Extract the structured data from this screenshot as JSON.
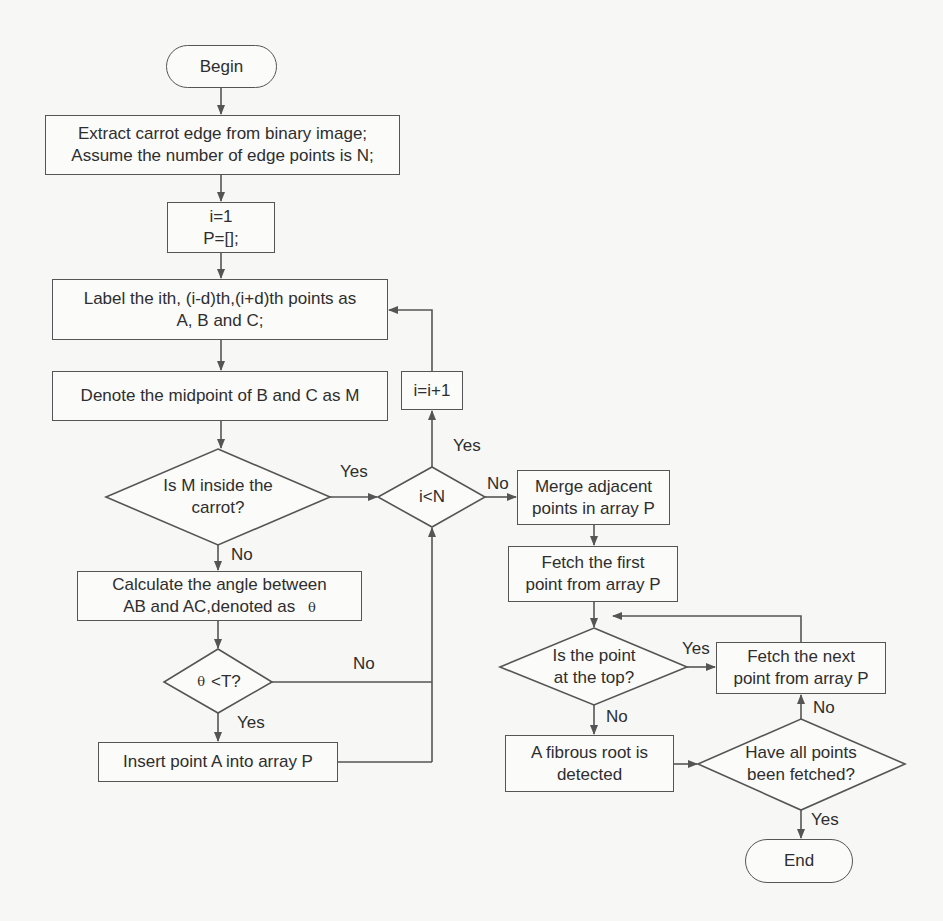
{
  "diagram": {
    "type": "flowchart",
    "colors": {
      "line": "#555555",
      "text": "#2e2e2e",
      "background": "#f7f7f5",
      "box_fill": "#fbfbfa"
    },
    "nodes": {
      "begin": {
        "label": "Begin"
      },
      "extract": {
        "line1": "Extract carrot edge from binary image;",
        "line2": "Assume the number of edge points is N;"
      },
      "init": {
        "line1": "i=1",
        "line2": "P=[];"
      },
      "label_points": {
        "line1": "Label the ith, (i-d)th,(i+d)th points as",
        "line2": "A, B and C;"
      },
      "midpoint": {
        "label": "Denote the midpoint of B and C as M"
      },
      "inside_decision": {
        "line1": "Is M inside the",
        "line2": "carrot?"
      },
      "calc_angle": {
        "line1": "Calculate the angle between",
        "line2": "AB and AC,denoted as",
        "symbol": "θ"
      },
      "angle_decision": {
        "symbol": "θ",
        "label": "<T?"
      },
      "insert_point": {
        "label": "Insert point A into array P"
      },
      "increment": {
        "label": "i=i+1"
      },
      "loop_decision": {
        "label": "i<N"
      },
      "merge": {
        "line1": "Merge adjacent",
        "line2": "points in array P"
      },
      "fetch_first": {
        "line1": "Fetch the first",
        "line2": "point from array P"
      },
      "top_decision": {
        "line1": "Is the point",
        "line2": "at the top?"
      },
      "fetch_next": {
        "line1": "Fetch the next",
        "line2": "point from array P"
      },
      "fibrous_root": {
        "line1": "A fibrous root is",
        "line2": "detected"
      },
      "all_fetched_decision": {
        "line1": "Have all points",
        "line2": "been fetched?"
      },
      "end": {
        "label": "End"
      }
    },
    "edge_labels": {
      "inside_yes": "Yes",
      "inside_no": "No",
      "angle_no": "No",
      "angle_yes": "Yes",
      "loop_yes": "Yes",
      "loop_no": "No",
      "top_yes": "Yes",
      "top_no": "No",
      "all_fetched_no": "No",
      "all_fetched_yes": "Yes"
    }
  }
}
